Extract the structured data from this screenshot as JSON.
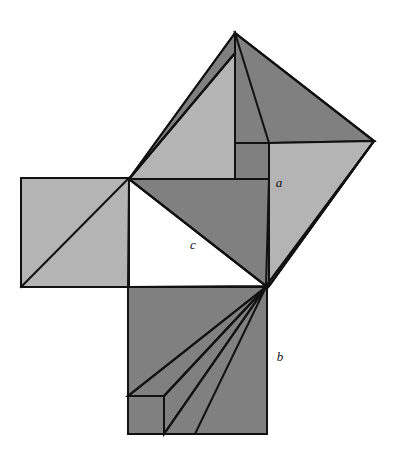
{
  "figure": {
    "name": "pythagorean-theorem-dissection-proof",
    "canvas": {
      "width": 399,
      "height": 465
    },
    "background_color": "#ffffff",
    "palette": {
      "light_gray": "#b4b4b4",
      "mid_gray": "#a8a8a8",
      "dark_gray": "#808080",
      "white": "#ffffff",
      "stroke": "#111111"
    },
    "stroke_width": 2,
    "labels": [
      {
        "id": "label-a",
        "text": "a",
        "x": 279,
        "y": 187
      },
      {
        "id": "label-c",
        "text": "c",
        "x": 193,
        "y": 249
      },
      {
        "id": "label-b",
        "text": "b",
        "x": 280,
        "y": 361
      }
    ],
    "key_points": {
      "central_vertex": {
        "x": 129,
        "y": 179
      },
      "right_angle_vertex": {
        "x": 266,
        "y": 286
      },
      "lower_left_vertex": {
        "x": 128,
        "y": 287
      },
      "apex": {
        "x": 235,
        "y": 33
      },
      "right_vertex": {
        "x": 374,
        "y": 141
      }
    },
    "regions": {
      "square_b_bottom": {
        "name": "square-on-leg-b",
        "points": "128,287 267,287 267,434 128,434",
        "fill": "#808080"
      },
      "square_left_leg": {
        "name": "square-on-leg-left",
        "points": "21,178 129,178 129,287 21,287",
        "fill": "#b4b4b4"
      },
      "tilted_square_hypotenuse": {
        "name": "tilted-square-on-hypotenuse",
        "points": "129,179 235,33 374,141 266,286",
        "fill": "#808080"
      },
      "central_triangle": {
        "name": "central-right-triangle",
        "points": "129,179 266,286 128,287",
        "fill": "#ffffff"
      }
    },
    "pieces": [
      {
        "id": "piece-upper-light-triangle",
        "points": "129,179 235,53 235,179",
        "fill": "#b4b4b4"
      },
      {
        "id": "piece-upper-dark-sliver",
        "points": "129,179 235,33 235,53",
        "fill": "#808080"
      },
      {
        "id": "piece-apex-dark-triangle",
        "points": "235,33 374,141 269,143",
        "fill": "#808080"
      },
      {
        "id": "piece-a-light-triangle",
        "points": "269,143 374,141 269,286",
        "fill": "#b4b4b4"
      },
      {
        "id": "piece-right-dark-sliver",
        "points": "374,141 266,286 269,286",
        "fill": "#808080"
      },
      {
        "id": "piece-mid-dark-triangle",
        "points": "129,179 269,179 266,286",
        "fill": "#808080"
      },
      {
        "id": "piece-inner-notch",
        "points": "235,143 269,143 269,179 235,179",
        "fill": "#808080"
      },
      {
        "id": "piece-b-fan-1",
        "points": "266,287 128,396 164,396",
        "fill": "#808080"
      },
      {
        "id": "piece-b-fan-2",
        "points": "266,287 164,396 164,434",
        "fill": "#808080"
      },
      {
        "id": "piece-b-fan-3",
        "points": "266,287 164,434 195,434",
        "fill": "#808080"
      }
    ],
    "lines": [
      {
        "id": "line-left-square-diagonal",
        "x1": 21,
        "y1": 287,
        "x2": 129,
        "y2": 178
      },
      {
        "id": "line-hypotenuse",
        "x1": 129,
        "y1": 179,
        "x2": 266,
        "y2": 286
      },
      {
        "id": "line-b-fan-a",
        "x1": 266,
        "y1": 287,
        "x2": 128,
        "y2": 396
      },
      {
        "id": "line-b-fan-b",
        "x1": 266,
        "y1": 287,
        "x2": 164,
        "y2": 396
      },
      {
        "id": "line-b-fan-c",
        "x1": 266,
        "y1": 287,
        "x2": 164,
        "y2": 434
      },
      {
        "id": "line-inner-square-top",
        "x1": 128,
        "y1": 396,
        "x2": 164,
        "y2": 396
      },
      {
        "id": "line-inner-square-right",
        "x1": 164,
        "y1": 396,
        "x2": 164,
        "y2": 434
      },
      {
        "id": "line-upper-vertical",
        "x1": 235,
        "y1": 33,
        "x2": 235,
        "y2": 179
      },
      {
        "id": "line-upper-horizontal",
        "x1": 129,
        "y1": 179,
        "x2": 269,
        "y2": 179
      },
      {
        "id": "line-notch-top",
        "x1": 235,
        "y1": 143,
        "x2": 269,
        "y2": 143
      },
      {
        "id": "line-notch-right",
        "x1": 269,
        "y1": 143,
        "x2": 269,
        "y2": 286
      },
      {
        "id": "line-apex-to-right",
        "x1": 235,
        "y1": 33,
        "x2": 374,
        "y2": 141
      },
      {
        "id": "line-apex-diag-inner",
        "x1": 235,
        "y1": 53,
        "x2": 129,
        "y2": 179
      },
      {
        "id": "line-right-to-corner",
        "x1": 374,
        "y1": 141,
        "x2": 269,
        "y2": 286
      }
    ]
  }
}
